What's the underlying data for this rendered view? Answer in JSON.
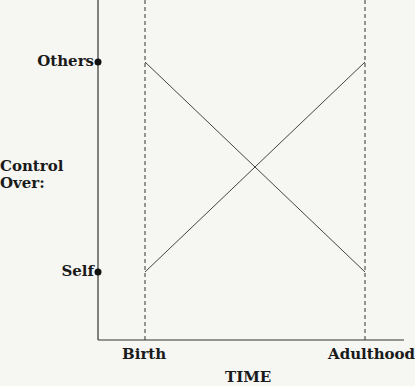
{
  "diagram": {
    "y_axis": {
      "title": "Control Over:",
      "ticks": [
        {
          "label": "Others",
          "level": "high"
        },
        {
          "label": "Self",
          "level": "low"
        }
      ]
    },
    "x_axis": {
      "title": "TIME",
      "ticks": [
        {
          "label": "Birth"
        },
        {
          "label": "Adulthood"
        }
      ]
    },
    "lines": [
      {
        "name": "control-over-others",
        "from": "Birth / Others",
        "to": "Adulthood / Self",
        "trend": "decreasing"
      },
      {
        "name": "control-over-self",
        "from": "Birth / Self",
        "to": "Adulthood / Others",
        "trend": "increasing"
      }
    ],
    "colors": {
      "line": "#444444",
      "text": "#1a1a1a",
      "background": "#f6f6f3"
    }
  }
}
